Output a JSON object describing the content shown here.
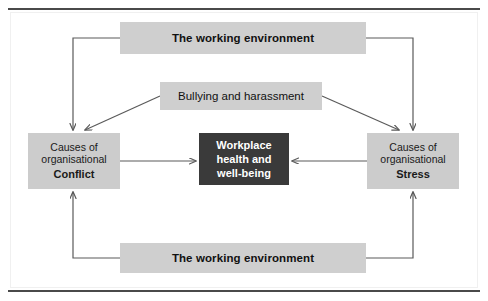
{
  "figure": {
    "background_color": "#ffffff",
    "rule_color": "#4a4a4a",
    "band_fill": "#cfcfcf",
    "side_fill": "#cccccc",
    "core_fill": "#3a3a3a",
    "core_text_color": "#ffffff",
    "connector_color": "#5a5a5a"
  },
  "nodes": {
    "top_environment": {
      "label": "The working environment"
    },
    "bullying": {
      "label": "Bullying and harassment"
    },
    "conflict": {
      "line1": "Causes of",
      "line2": "organisational",
      "line3": "Conflict"
    },
    "stress": {
      "line1": "Causes of",
      "line2": "organisational",
      "line3": "Stress"
    },
    "core": {
      "line1": "Workplace",
      "line2": "health and",
      "line3": "well-being"
    },
    "bottom_environment": {
      "label": "The working environment"
    }
  },
  "connectors": [
    {
      "name": "top-env-to-conflict",
      "from": "top_environment",
      "to": "conflict",
      "style": "elbow",
      "arrow": "to"
    },
    {
      "name": "top-env-to-stress",
      "from": "top_environment",
      "to": "stress",
      "style": "elbow",
      "arrow": "to"
    },
    {
      "name": "bullying-to-conflict",
      "from": "bullying",
      "to": "conflict",
      "style": "diagonal",
      "arrow": "to"
    },
    {
      "name": "bullying-to-stress",
      "from": "bullying",
      "to": "stress",
      "style": "diagonal",
      "arrow": "to"
    },
    {
      "name": "conflict-to-core",
      "from": "conflict",
      "to": "core",
      "style": "straight",
      "arrow": "to"
    },
    {
      "name": "stress-to-core",
      "from": "stress",
      "to": "core",
      "style": "straight",
      "arrow": "to"
    },
    {
      "name": "bottom-env-to-conflict",
      "from": "bottom_environment",
      "to": "conflict",
      "style": "elbow",
      "arrow": "to"
    },
    {
      "name": "bottom-env-to-stress",
      "from": "bottom_environment",
      "to": "stress",
      "style": "elbow",
      "arrow": "to"
    }
  ]
}
